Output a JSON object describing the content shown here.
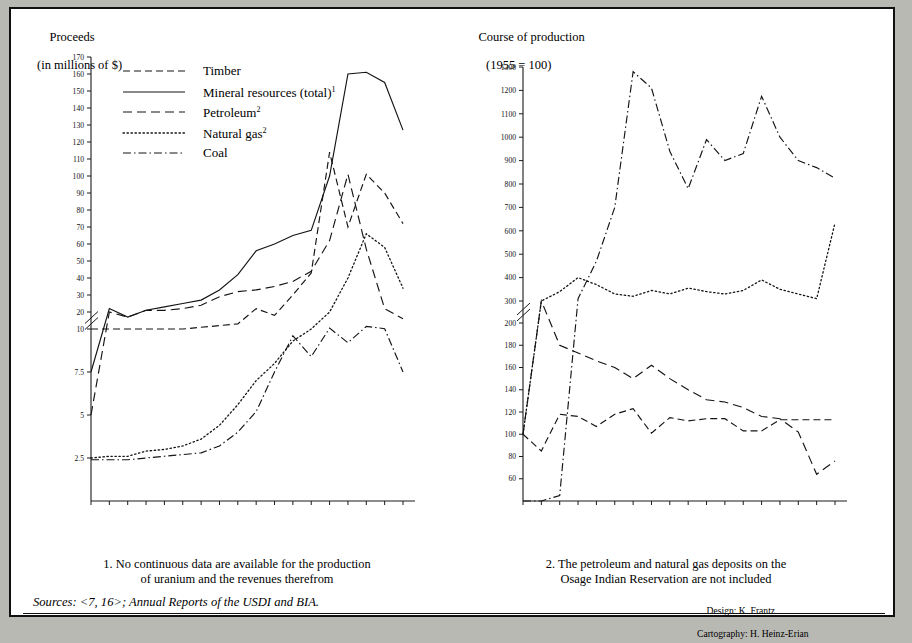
{
  "figure": {
    "background": "#b9b9b4",
    "paper": "#ffffff",
    "ink": "#141414"
  },
  "left_header": {
    "line1": "Proceeds",
    "line2": "(in millions of $)"
  },
  "right_header": {
    "line1": "Course of production",
    "line2": "(1955 = 100)"
  },
  "legend": {
    "position": "inside-top-left",
    "items": [
      {
        "label": "Timber",
        "sup": "",
        "style": "dashed"
      },
      {
        "label": "Mineral resources (total)",
        "sup": "1",
        "style": "solid"
      },
      {
        "label": "Petroleum",
        "sup": "2",
        "style": "long-dashed"
      },
      {
        "label": "Natural gas",
        "sup": "2",
        "style": "dotted"
      },
      {
        "label": "Coal",
        "sup": "",
        "style": "dash-dot"
      }
    ]
  },
  "footnotes": {
    "note1": {
      "line1": "1. No continuous data are available for the production",
      "line2": "of uranium and the revenues therefrom"
    },
    "note2": {
      "line1": "2. The petroleum and natural gas deposits on the",
      "line2": "Osage Indian Reservation are not included"
    }
  },
  "sources": "Sources: <7, 16>; Annual Reports of the USDI and BIA.",
  "credits": {
    "design": "Design: K. Frantz",
    "cartography": "Cartography: H. Heinz-Erian"
  },
  "chart_data": [
    {
      "id": "proceeds",
      "type": "line",
      "title": "Proceeds",
      "subtitle": "(in millions of $)",
      "xlabel": "",
      "ylabel": "Proceeds (in millions of $)",
      "grid": false,
      "axis_break": {
        "between": [
          10,
          20
        ],
        "note": "y-axis broken; lower segment 2.5-10 compressed"
      },
      "ytick_labels": [
        "2.5",
        "5",
        "7.5",
        "10",
        "20",
        "30",
        "40",
        "50",
        "60",
        "70",
        "80",
        "90",
        "100",
        "110",
        "120",
        "130",
        "140",
        "150",
        "160",
        "170"
      ],
      "ylim": [
        0,
        170
      ],
      "x": [
        1955,
        1960,
        1965,
        1970,
        1971,
        1972,
        1973,
        1974,
        1975,
        1976,
        1977,
        1978,
        1979,
        1980,
        1981,
        1982,
        1983,
        1984
      ],
      "xtick_labels": [
        "1955",
        "1960",
        "1965",
        "1970",
        "1971",
        "1972",
        "1973",
        "1974",
        "1975",
        "1976",
        "1977",
        "1978",
        "1979",
        "1980",
        "1981",
        "1982",
        "1983",
        "1984"
      ],
      "series": [
        {
          "name": "Timber",
          "style": "dashed",
          "x": [
            1955,
            1960,
            1965,
            1970,
            1971,
            1972,
            1973,
            1974,
            1975,
            1976,
            1977,
            1978,
            1979,
            1980,
            1981,
            1982,
            1983,
            1984
          ],
          "values": [
            10,
            10,
            10,
            10,
            10,
            10,
            11,
            12,
            13,
            22,
            18,
            30,
            43,
            114,
            70,
            101,
            90,
            72
          ]
        },
        {
          "name": "Mineral resources (total)",
          "style": "solid",
          "x": [
            1955,
            1960,
            1965,
            1970,
            1971,
            1972,
            1973,
            1974,
            1975,
            1976,
            1977,
            1978,
            1979,
            1980,
            1981,
            1982,
            1983,
            1984
          ],
          "values": [
            7.5,
            22,
            17,
            21,
            23,
            25,
            27,
            33,
            42,
            56,
            60,
            65,
            68,
            100,
            160,
            161,
            155,
            127
          ]
        },
        {
          "name": "Petroleum",
          "style": "long-dashed",
          "x": [
            1955,
            1960,
            1965,
            1970,
            1971,
            1972,
            1973,
            1974,
            1975,
            1976,
            1977,
            1978,
            1979,
            1980,
            1981,
            1982,
            1983,
            1984
          ],
          "values": [
            5,
            20,
            17,
            21,
            21,
            22,
            24,
            29,
            32,
            33,
            35,
            38,
            44,
            62,
            101,
            57,
            22,
            16
          ]
        },
        {
          "name": "Natural gas",
          "style": "dotted",
          "x": [
            1955,
            1960,
            1965,
            1970,
            1971,
            1972,
            1973,
            1974,
            1975,
            1976,
            1977,
            1978,
            1979,
            1980,
            1981,
            1982,
            1983,
            1984
          ],
          "values": [
            2.5,
            2.6,
            2.6,
            2.9,
            3.0,
            3.2,
            3.6,
            4.4,
            5.6,
            7.0,
            8.0,
            9.3,
            10,
            20,
            40,
            66,
            58,
            34
          ]
        },
        {
          "name": "Coal",
          "style": "dash-dot",
          "x": [
            1955,
            1960,
            1965,
            1970,
            1971,
            1972,
            1973,
            1974,
            1975,
            1976,
            1977,
            1978,
            1979,
            1980,
            1981,
            1982,
            1983,
            1984
          ],
          "values": [
            2.4,
            2.4,
            2.4,
            2.5,
            2.6,
            2.7,
            2.8,
            3.2,
            4.0,
            5.2,
            7.5,
            9.6,
            8.4,
            10.5,
            9.2,
            11.5,
            10.2,
            7.5
          ]
        }
      ]
    },
    {
      "id": "course_of_production",
      "type": "line",
      "title": "Course of production",
      "subtitle": "(1955 = 100)",
      "xlabel": "",
      "ylabel": "Index (1955 = 100)",
      "grid": false,
      "axis_break": {
        "between": [
          200,
          300
        ],
        "note": "y-axis broken between 200 and 300"
      },
      "ytick_labels": [
        "60",
        "80",
        "100",
        "120",
        "140",
        "160",
        "180",
        "200",
        "300",
        "400",
        "500",
        "600",
        "700",
        "800",
        "900",
        "1000",
        "1100",
        "1200",
        "1300"
      ],
      "ylim": [
        40,
        1300
      ],
      "x": [
        1955,
        1960,
        1965,
        1970,
        1971,
        1972,
        1973,
        1974,
        1975,
        1976,
        1977,
        1978,
        1979,
        1980,
        1981,
        1982,
        1983,
        1984
      ],
      "xtick_labels": [
        "1955",
        "1960",
        "1965",
        "1970",
        "1971",
        "1972",
        "1973",
        "1974",
        "1975",
        "1976",
        "1977",
        "1978",
        "1979",
        "1980",
        "1981",
        "1982",
        "1983",
        "1984"
      ],
      "series": [
        {
          "name": "Timber",
          "style": "dashed",
          "x": [
            1955,
            1960,
            1965,
            1970,
            1971,
            1972,
            1973,
            1974,
            1975,
            1976,
            1977,
            1978,
            1979,
            1980,
            1981,
            1982,
            1983,
            1984
          ],
          "values": [
            100,
            85,
            118,
            116,
            107,
            118,
            123,
            101,
            115,
            112,
            114,
            114,
            103,
            103,
            113,
            113,
            113,
            113
          ]
        },
        {
          "name": "Petroleum",
          "style": "long-dashed",
          "x": [
            1955,
            1960,
            1965,
            1970,
            1971,
            1972,
            1973,
            1974,
            1975,
            1976,
            1977,
            1978,
            1979,
            1980,
            1981,
            1982,
            1983,
            1984
          ],
          "values": [
            100,
            300,
            180,
            173,
            166,
            160,
            150,
            162,
            150,
            140,
            131,
            129,
            124,
            116,
            114,
            102,
            64,
            76
          ]
        },
        {
          "name": "Natural gas",
          "style": "dotted",
          "x": [
            1955,
            1960,
            1965,
            1970,
            1971,
            1972,
            1973,
            1974,
            1975,
            1976,
            1977,
            1978,
            1979,
            1980,
            1981,
            1982,
            1983,
            1984
          ],
          "values": [
            100,
            300,
            340,
            400,
            370,
            330,
            320,
            345,
            330,
            355,
            340,
            330,
            345,
            390,
            350,
            330,
            310,
            290
          ]
        },
        {
          "name": "Coal",
          "style": "dash-dot",
          "x": [
            1955,
            1960,
            1965,
            1970,
            1971,
            1972,
            1973,
            1974,
            1975,
            1976,
            1977,
            1978,
            1979,
            1980,
            1981,
            1982,
            1983,
            1984
          ],
          "values": [
            40,
            40,
            45,
            310,
            470,
            700,
            1280,
            1210,
            940,
            780,
            990,
            900,
            930,
            1175,
            1000,
            900,
            870,
            825
          ]
        }
      ]
    }
  ]
}
